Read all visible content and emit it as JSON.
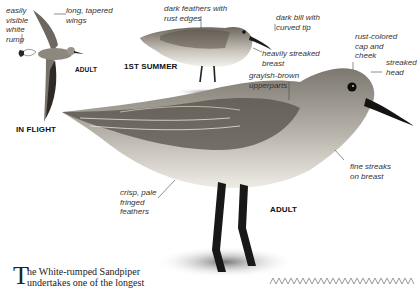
{
  "figures": {
    "in_flight": {
      "caption": "IN FLIGHT",
      "sub_caption": "ADULT",
      "labels": {
        "rump": [
          "easily",
          "visible",
          "white",
          "rump"
        ],
        "wings": [
          "long, tapered",
          "wings"
        ]
      }
    },
    "first_summer": {
      "caption": "1ST SUMMER",
      "labels": {
        "feathers": [
          "dark feathers with",
          "rust edges"
        ],
        "bill": [
          "dark bill with",
          "curved tip"
        ],
        "breast": [
          "heavily streaked",
          "breast"
        ]
      }
    },
    "adult": {
      "caption": "ADULT",
      "labels": {
        "upperparts": [
          "grayish-brown",
          "upperparts"
        ],
        "cap": [
          "rust-colored",
          "cap and",
          "cheek"
        ],
        "head": [
          "streaked",
          "head"
        ],
        "fine_streaks": [
          "fine streaks",
          "on breast"
        ],
        "fringed": [
          "crisp, pale",
          "fringed",
          "feathers"
        ]
      }
    }
  },
  "body_text": {
    "drop_cap": "T",
    "line1": "he White-rumped Sandpiper",
    "line2": "undertakes one of the longest"
  },
  "colors": {
    "label_text": "#333333",
    "caption_text": "#111111",
    "zigzag": "#9a9a9a"
  }
}
